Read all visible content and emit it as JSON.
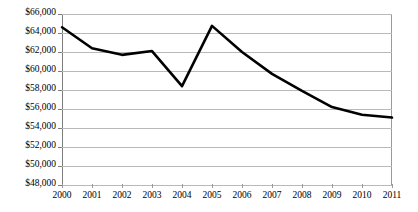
{
  "chart_data": {
    "type": "line",
    "title": "",
    "subtitle": "",
    "xlabel": "",
    "ylabel": "",
    "categories": [
      "2000",
      "2001",
      "2002",
      "2003",
      "2004",
      "2005",
      "2006",
      "2007",
      "2008",
      "2009",
      "2010",
      "2011"
    ],
    "x": [
      2000,
      2001,
      2002,
      2003,
      2004,
      2005,
      2006,
      2007,
      2008,
      2009,
      2010,
      2011
    ],
    "series": [
      {
        "name": "",
        "values": [
          64600,
          62400,
          61700,
          62100,
          58400,
          64750,
          62000,
          59700,
          57900,
          56200,
          55400,
          55100
        ]
      }
    ],
    "ylim": [
      48000,
      66000
    ],
    "ytick_values": [
      48000,
      50000,
      52000,
      54000,
      56000,
      58000,
      60000,
      62000,
      64000,
      66000
    ],
    "ytick_labels": [
      "$48,000",
      "$50,000",
      "$52,000",
      "$54,000",
      "$56,000",
      "$58,000",
      "$60,000",
      "$62,000",
      "$64,000",
      "$66,000"
    ],
    "xtick_labels": [
      "2000",
      "2001",
      "2002",
      "2003",
      "2004",
      "2005",
      "2006",
      "2007",
      "2008",
      "2009",
      "2010",
      "2011"
    ],
    "grid": true,
    "grid_axis": "y",
    "legend": false,
    "legend_position": "none",
    "annotations": [],
    "colors": {
      "line": "#000000",
      "grid": "#b9b9b9",
      "axis": "#7d7d7d",
      "background": "#ffffff",
      "text": "#000000"
    },
    "line_width": 2.6
  }
}
